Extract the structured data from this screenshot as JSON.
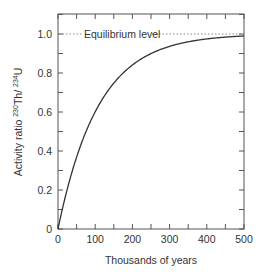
{
  "chart_data": {
    "type": "line",
    "title": "",
    "xlabel": "Thousands of years",
    "ylabel": {
      "prefix": "Activity ratio ",
      "num_sup": "230",
      "num": "Th/ ",
      "den_sup": "234",
      "den": "U"
    },
    "xlim": [
      0,
      500
    ],
    "ylim": [
      0,
      1.1
    ],
    "x_ticks": [
      0,
      100,
      200,
      300,
      400,
      500
    ],
    "x_tick_labels": [
      "0",
      "100",
      "200",
      "300",
      "400",
      "500"
    ],
    "x_minor_step": 50,
    "y_ticks": [
      0,
      0.2,
      0.4,
      0.6,
      0.8,
      1.0
    ],
    "y_tick_labels": [
      "0",
      "0.2",
      "0.4",
      "0.6",
      "0.8",
      "1.0"
    ],
    "y_minor_step": 0.1,
    "grid": false,
    "legend": null,
    "series": [
      {
        "name": "230Th/234U ingrowth",
        "x": [
          0,
          25,
          50,
          75,
          100,
          125,
          150,
          175,
          200,
          225,
          250,
          275,
          300,
          325,
          350,
          375,
          400,
          425,
          450,
          475,
          500
        ],
        "values": [
          0,
          0.21,
          0.37,
          0.5,
          0.6,
          0.68,
          0.75,
          0.8,
          0.84,
          0.87,
          0.9,
          0.92,
          0.936,
          0.95,
          0.96,
          0.968,
          0.975,
          0.98,
          0.984,
          0.987,
          0.99
        ]
      }
    ],
    "annotations": [
      {
        "type": "hline",
        "y": 1.0,
        "style": "dotted",
        "label": "Equilibrium level"
      }
    ],
    "colors": {
      "axis": "#555555",
      "curve": "#333333",
      "text": "#333333",
      "equilibrium": "#888888"
    }
  }
}
